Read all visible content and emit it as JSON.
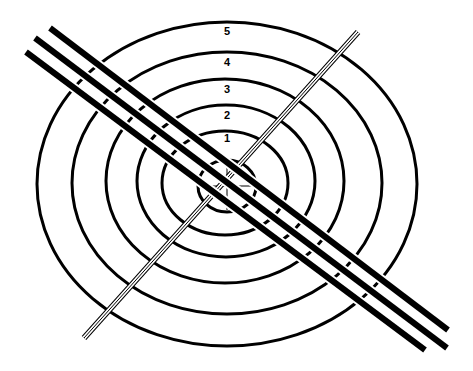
{
  "diagram": {
    "colors": {
      "stroke": "#000000",
      "background": "#ffffff"
    },
    "rings": [
      {
        "label": "5",
        "cx": 227,
        "cy": 184,
        "rx": 190,
        "ry": 162,
        "label_x": 227,
        "label_y": 35
      },
      {
        "label": "4",
        "cx": 227,
        "cy": 183,
        "rx": 155,
        "ry": 131,
        "label_x": 227,
        "label_y": 66
      },
      {
        "label": "3",
        "cx": 225,
        "cy": 181,
        "rx": 119,
        "ry": 102,
        "label_x": 227,
        "label_y": 93
      },
      {
        "label": "2",
        "cx": 226,
        "cy": 181,
        "rx": 89,
        "ry": 76,
        "label_x": 227,
        "label_y": 119
      },
      {
        "label": "1",
        "cx": 225,
        "cy": 183,
        "rx": 63,
        "ry": 52,
        "label_x": 227,
        "label_y": 142
      }
    ],
    "bullseye": {
      "cx": 227,
      "cy": 186,
      "rx": 29,
      "ry": 26
    },
    "crosshair": {
      "cx": 227,
      "cy": 186,
      "h_len": 26,
      "v_len": 24
    },
    "thick_lines": [
      {
        "x1": 50,
        "y1": 28,
        "x2": 448,
        "y2": 330
      },
      {
        "x1": 35,
        "y1": 38,
        "x2": 447,
        "y2": 348
      },
      {
        "x1": 26,
        "y1": 52,
        "x2": 425,
        "y2": 350
      }
    ],
    "thin_line": {
      "x1": 358,
      "y1": 32,
      "x2": 84,
      "y2": 338
    }
  }
}
